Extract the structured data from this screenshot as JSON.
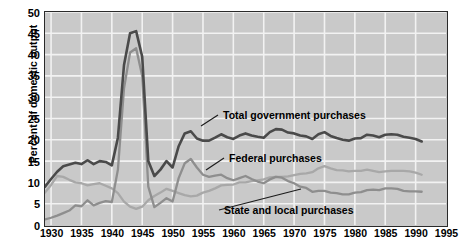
{
  "chart_data": {
    "type": "line",
    "title": "",
    "xlabel": "",
    "ylabel": "Percent of domestic output",
    "xlim": [
      1929,
      1995
    ],
    "ylim": [
      0,
      50
    ],
    "xticks": [
      1930,
      1935,
      1940,
      1945,
      1950,
      1955,
      1960,
      1965,
      1970,
      1975,
      1980,
      1985,
      1990,
      1995
    ],
    "yticks": [
      0,
      5,
      10,
      15,
      20,
      25,
      30,
      35,
      40,
      45,
      50
    ],
    "grid": true,
    "legend_position": "inline-annotations",
    "annotations": [
      {
        "text": "Total government purchases",
        "series": "Total government purchases",
        "x": 1959,
        "y": 22.0
      },
      {
        "text": "Federal purchases",
        "series": "Federal purchases",
        "x": 1957,
        "y": 14.5
      },
      {
        "text": "State and local purchases",
        "series": "State and local purchases",
        "x": 1963,
        "y": 6.8
      }
    ],
    "series": [
      {
        "name": "Total government purchases",
        "color": "#4a4a4a",
        "x": [
          1929,
          1930,
          1931,
          1932,
          1933,
          1934,
          1935,
          1936,
          1937,
          1938,
          1939,
          1940,
          1941,
          1942,
          1943,
          1944,
          1945,
          1946,
          1947,
          1948,
          1949,
          1950,
          1951,
          1952,
          1953,
          1954,
          1955,
          1956,
          1957,
          1958,
          1959,
          1960,
          1961,
          1962,
          1963,
          1964,
          1965,
          1966,
          1967,
          1968,
          1969,
          1970,
          1971,
          1972,
          1973,
          1974,
          1975,
          1976,
          1977,
          1978,
          1979,
          1980,
          1981,
          1982,
          1983,
          1984,
          1985,
          1986,
          1987,
          1988,
          1989,
          1990,
          1991
        ],
        "y": [
          9.0,
          10.8,
          12.5,
          13.8,
          14.2,
          14.6,
          14.3,
          15.2,
          14.3,
          15.0,
          14.8,
          14.0,
          20.5,
          37.5,
          45.0,
          45.5,
          39.5,
          15.0,
          11.5,
          13.0,
          15.0,
          13.5,
          18.5,
          21.5,
          22.0,
          20.3,
          19.8,
          19.8,
          20.5,
          21.3,
          20.6,
          20.2,
          21.0,
          21.5,
          21.0,
          20.7,
          20.5,
          21.8,
          22.5,
          22.4,
          21.7,
          21.5,
          21.0,
          20.8,
          20.2,
          21.3,
          21.8,
          20.9,
          20.4,
          20.0,
          19.8,
          20.3,
          20.4,
          21.2,
          21.0,
          20.6,
          21.2,
          21.3,
          21.2,
          20.7,
          20.5,
          20.2,
          19.6
        ]
      },
      {
        "name": "Federal purchases",
        "color": "#8e8e8e",
        "x": [
          1929,
          1930,
          1931,
          1932,
          1933,
          1934,
          1935,
          1936,
          1937,
          1938,
          1939,
          1940,
          1941,
          1942,
          1943,
          1944,
          1945,
          1946,
          1947,
          1948,
          1949,
          1950,
          1951,
          1952,
          1953,
          1954,
          1955,
          1956,
          1957,
          1958,
          1959,
          1960,
          1961,
          1962,
          1963,
          1964,
          1965,
          1966,
          1967,
          1968,
          1969,
          1970,
          1971,
          1972,
          1973,
          1974,
          1975,
          1976,
          1977,
          1978,
          1979,
          1980,
          1981,
          1982,
          1983,
          1984,
          1985,
          1986,
          1987,
          1988,
          1989,
          1990,
          1991
        ],
        "y": [
          1.3,
          1.7,
          2.2,
          2.8,
          3.4,
          4.6,
          4.4,
          5.8,
          4.6,
          5.2,
          5.6,
          5.4,
          13.0,
          32.0,
          40.5,
          41.5,
          35.0,
          9.0,
          4.2,
          5.2,
          6.3,
          5.5,
          11.0,
          14.5,
          15.5,
          13.5,
          11.8,
          11.3,
          11.6,
          11.8,
          11.0,
          10.5,
          11.0,
          11.5,
          10.8,
          10.2,
          9.8,
          10.7,
          11.3,
          11.1,
          10.3,
          9.8,
          9.0,
          8.7,
          7.8,
          8.0,
          8.0,
          7.6,
          7.5,
          7.2,
          7.2,
          7.6,
          7.7,
          8.2,
          8.3,
          8.2,
          8.6,
          8.6,
          8.5,
          8.0,
          7.9,
          7.9,
          7.8
        ]
      },
      {
        "name": "State and local purchases",
        "color": "#a8a8a8",
        "x": [
          1929,
          1930,
          1931,
          1932,
          1933,
          1934,
          1935,
          1936,
          1937,
          1938,
          1939,
          1940,
          1941,
          1942,
          1943,
          1944,
          1945,
          1946,
          1947,
          1948,
          1949,
          1950,
          1951,
          1952,
          1953,
          1954,
          1955,
          1956,
          1957,
          1958,
          1959,
          1960,
          1961,
          1962,
          1963,
          1964,
          1965,
          1966,
          1967,
          1968,
          1969,
          1970,
          1971,
          1972,
          1973,
          1974,
          1975,
          1976,
          1977,
          1978,
          1979,
          1980,
          1981,
          1982,
          1983,
          1984,
          1985,
          1986,
          1987,
          1988,
          1989,
          1990,
          1991
        ],
        "y": [
          7.6,
          9.4,
          11.5,
          11.3,
          10.6,
          10.0,
          9.8,
          9.3,
          9.6,
          9.8,
          9.2,
          8.6,
          7.5,
          5.5,
          4.3,
          3.8,
          4.3,
          5.8,
          6.8,
          7.6,
          8.5,
          8.0,
          7.5,
          7.0,
          6.7,
          6.9,
          7.6,
          8.0,
          8.6,
          9.3,
          9.4,
          9.5,
          10.0,
          10.0,
          10.3,
          10.5,
          10.7,
          11.2,
          11.3,
          11.3,
          11.4,
          11.7,
          12.0,
          12.1,
          12.4,
          13.3,
          13.8,
          13.3,
          12.9,
          12.8,
          12.6,
          12.7,
          12.7,
          13.0,
          12.7,
          12.4,
          12.6,
          12.7,
          12.7,
          12.7,
          12.6,
          12.3,
          11.8
        ]
      }
    ]
  }
}
